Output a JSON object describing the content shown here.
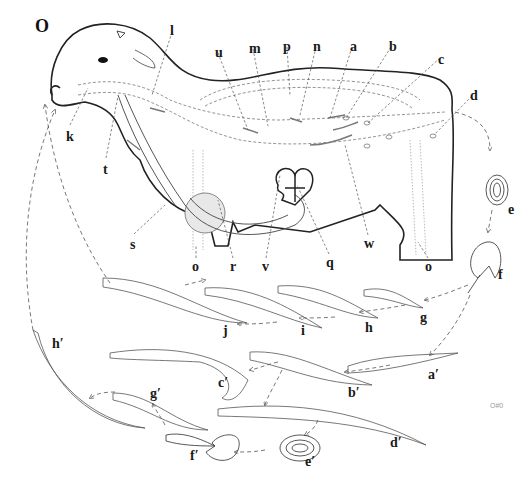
{
  "figure": {
    "panel_letter": "O",
    "signature": "O#0",
    "colors": {
      "outline": "#222222",
      "structure": "#9a9a9a",
      "dashed_path": "#555555",
      "shading": "#d8d8d8"
    }
  },
  "host_labels": [
    {
      "id": "k",
      "text": "k",
      "x": 66,
      "y": 130
    },
    {
      "id": "l",
      "text": "l",
      "x": 170,
      "y": 24
    },
    {
      "id": "t",
      "text": "t",
      "x": 103,
      "y": 163
    },
    {
      "id": "u",
      "text": "u",
      "x": 215,
      "y": 46
    },
    {
      "id": "m",
      "text": "m",
      "x": 250,
      "y": 42
    },
    {
      "id": "p",
      "text": "p",
      "x": 283,
      "y": 40
    },
    {
      "id": "n",
      "text": "n",
      "x": 313,
      "y": 40
    },
    {
      "id": "a",
      "text": "a",
      "x": 350,
      "y": 40
    },
    {
      "id": "b",
      "text": "b",
      "x": 389,
      "y": 40
    },
    {
      "id": "c",
      "text": "c",
      "x": 438,
      "y": 53
    },
    {
      "id": "d",
      "text": "d",
      "x": 470,
      "y": 89
    },
    {
      "id": "s",
      "text": "s",
      "x": 130,
      "y": 238
    },
    {
      "id": "r",
      "text": "r",
      "x": 230,
      "y": 262
    },
    {
      "id": "v",
      "text": "v",
      "x": 263,
      "y": 262
    },
    {
      "id": "q",
      "text": "q",
      "x": 327,
      "y": 258
    },
    {
      "id": "w",
      "text": "w",
      "x": 365,
      "y": 239
    },
    {
      "id": "o1",
      "text": "o",
      "x": 193,
      "y": 262
    },
    {
      "id": "o2",
      "text": "o",
      "x": 425,
      "y": 262
    }
  ],
  "cycle_labels": [
    {
      "id": "e",
      "text": "e",
      "x": 508,
      "y": 204
    },
    {
      "id": "f",
      "text": "f",
      "x": 498,
      "y": 270
    },
    {
      "id": "g",
      "text": "g",
      "x": 420,
      "y": 313
    },
    {
      "id": "h",
      "text": "h",
      "x": 365,
      "y": 323
    },
    {
      "id": "i",
      "text": "i",
      "x": 301,
      "y": 326
    },
    {
      "id": "j",
      "text": "j",
      "x": 223,
      "y": 326
    },
    {
      "id": "a_prime",
      "text": "a′",
      "x": 428,
      "y": 370
    },
    {
      "id": "b_prime",
      "text": "b′",
      "x": 348,
      "y": 388
    },
    {
      "id": "c_prime",
      "text": "c′",
      "x": 218,
      "y": 378
    },
    {
      "id": "d_prime",
      "text": "d′",
      "x": 390,
      "y": 438
    },
    {
      "id": "e_prime",
      "text": "e′",
      "x": 305,
      "y": 457
    },
    {
      "id": "f_prime",
      "text": "f′",
      "x": 190,
      "y": 451
    },
    {
      "id": "g_prime",
      "text": "g′",
      "x": 150,
      "y": 389
    },
    {
      "id": "h_prime",
      "text": "h′",
      "x": 52,
      "y": 339
    }
  ]
}
